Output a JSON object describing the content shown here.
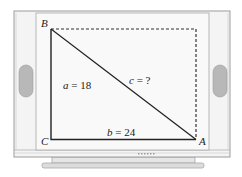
{
  "figure": {
    "type": "right-triangle-on-tv-screen",
    "vertices": {
      "B": "B",
      "C": "C",
      "A": "A"
    },
    "sides": {
      "a": {
        "var": "a",
        "value": "18",
        "text": "a = 18"
      },
      "b": {
        "var": "b",
        "value": "24",
        "text": "b = 24"
      },
      "c": {
        "var": "c",
        "value": "?",
        "text": "c = ?"
      }
    },
    "colors": {
      "frame": "#f4f4f4",
      "frame_border": "#a0a0a0",
      "speaker": "#b8b8b8",
      "line": "#222222",
      "dashed": "#333333"
    }
  }
}
